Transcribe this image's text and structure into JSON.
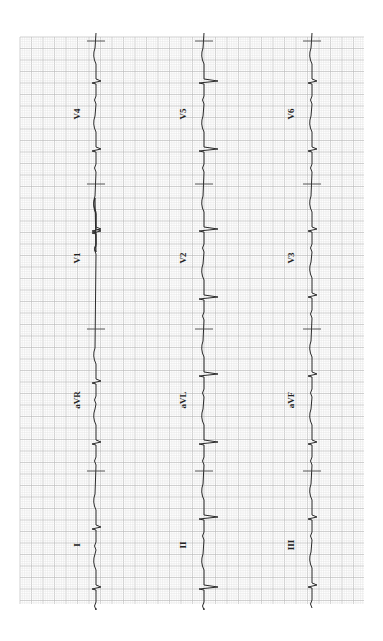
{
  "ecg": {
    "orientation": "rotated-90-clockwise",
    "grid": {
      "left": 20,
      "top": 37,
      "right": 364,
      "bottom": 604,
      "minor_step": 2.3,
      "major_step": 11.5,
      "minor_color": "#e4e4e4",
      "major_color": "#bdbdbd",
      "background": "#ffffff"
    },
    "trace_color": "#2a2a2a",
    "rows": [
      {
        "baseline_x": 96,
        "leads": [
          {
            "label": "I",
            "label_x": 80,
            "label_y": 545
          },
          {
            "label": "aVR",
            "label_x": 80,
            "label_y": 400
          },
          {
            "label": "V1",
            "label_x": 80,
            "label_y": 258
          },
          {
            "label": "V4",
            "label_x": 80,
            "label_y": 114
          }
        ],
        "beats_y": [
          588,
          528,
          443,
          382,
          232,
          230,
          150,
          82
        ],
        "qrs_style": "small-biphasic"
      },
      {
        "baseline_x": 204,
        "leads": [
          {
            "label": "II",
            "label_x": 186,
            "label_y": 545
          },
          {
            "label": "aVL",
            "label_x": 186,
            "label_y": 400
          },
          {
            "label": "V2",
            "label_x": 186,
            "label_y": 258
          },
          {
            "label": "V5",
            "label_x": 186,
            "label_y": 114
          }
        ],
        "beats_y": [
          588,
          518,
          443,
          375,
          298,
          230,
          150,
          82
        ],
        "qrs_style": "deep-s"
      },
      {
        "baseline_x": 312,
        "leads": [
          {
            "label": "III",
            "label_x": 294,
            "label_y": 545
          },
          {
            "label": "aVF",
            "label_x": 294,
            "label_y": 400
          },
          {
            "label": "V3",
            "label_x": 294,
            "label_y": 258
          },
          {
            "label": "V6",
            "label_x": 294,
            "label_y": 114
          }
        ],
        "beats_y": [
          586,
          518,
          443,
          375,
          296,
          230,
          150,
          82
        ],
        "qrs_style": "small-biphasic"
      }
    ],
    "lead_separators_y": [
      41,
      184,
      329,
      471
    ],
    "separator_half_width": 9
  }
}
